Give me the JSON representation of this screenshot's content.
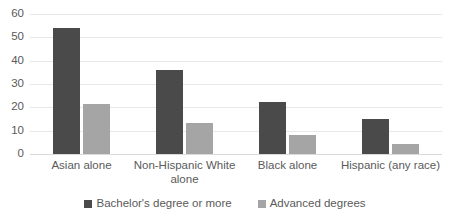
{
  "chart_data": {
    "type": "bar",
    "title": "",
    "subtitle": "",
    "xlabel": "",
    "ylabel": "",
    "ylim": [
      0,
      60
    ],
    "yticks": [
      0,
      10,
      20,
      30,
      40,
      50,
      60
    ],
    "grid": true,
    "legend_position": "bottom",
    "categories": [
      "Asian alone",
      "Non-Hispanic White alone",
      "Black alone",
      "Hispanic (any race)"
    ],
    "series": [
      {
        "name": "Bachelor's degree or more",
        "color": "#4a4a4a",
        "values": [
          54,
          36,
          22.5,
          15.2
        ]
      },
      {
        "name": "Advanced degrees",
        "color": "#a5a5a5",
        "values": [
          21.3,
          13.3,
          8,
          4.3
        ]
      }
    ]
  },
  "axis": {
    "y_tick_labels": [
      "0",
      "10",
      "20",
      "30",
      "40",
      "50",
      "60"
    ],
    "x_tick_labels": [
      "Asian alone",
      "Non-Hispanic White alone",
      "Black alone",
      "Hispanic (any race)"
    ]
  },
  "legend": {
    "items": [
      {
        "label": "Bachelor's degree or more",
        "color": "#4a4a4a"
      },
      {
        "label": "Advanced degrees",
        "color": "#a5a5a5"
      }
    ]
  },
  "colors": {
    "series_bachelors": "#4a4a4a",
    "series_advanced": "#a5a5a5",
    "gridline": "#e8e8e8",
    "axis_text": "#5a5a5a",
    "background": "#ffffff"
  }
}
